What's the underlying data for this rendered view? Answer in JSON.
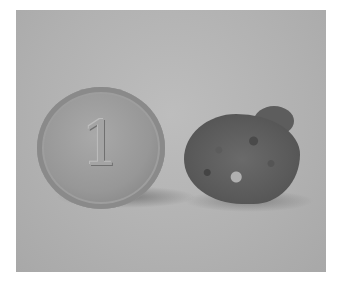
{
  "image": {
    "description": "Grayscale photograph of a coin standing upright beside a rough rock specimen for scale",
    "coin": {
      "numeral": "1"
    },
    "colors": {
      "background": "#b4b4b4",
      "coin": "#979797",
      "rock": "#5a5a5a",
      "frame": "#ffffff"
    }
  }
}
